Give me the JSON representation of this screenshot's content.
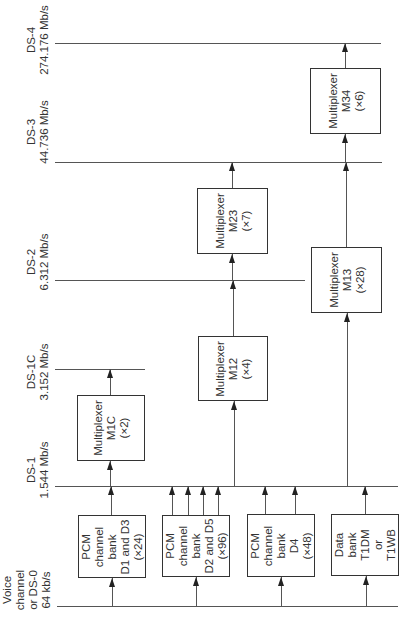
{
  "levels": [
    {
      "id": "ds4",
      "name": "DS-4",
      "rate": "274.176 Mb/s"
    },
    {
      "id": "ds3",
      "name": "DS-3",
      "rate": "44.736 Mb/s"
    },
    {
      "id": "ds2",
      "name": "DS-2",
      "rate": "6.312 Mb/s"
    },
    {
      "id": "ds1c",
      "name": "DS-1C",
      "rate": "3.152 Mb/s"
    },
    {
      "id": "ds1",
      "name": "DS-1",
      "rate": "1.544 Mb/s"
    },
    {
      "id": "ds0",
      "lines": [
        "Voice",
        "channel",
        "or DS-0",
        "64 kb/s"
      ]
    }
  ],
  "multiplexers": {
    "m34": {
      "lines": [
        "Multiplexer",
        "M34",
        "(×6)"
      ]
    },
    "m23": {
      "lines": [
        "Multiplexer",
        "M23",
        "(×7)"
      ]
    },
    "m13": {
      "lines": [
        "Multiplexer",
        "M13",
        "(×28)"
      ]
    },
    "m12": {
      "lines": [
        "Multiplexer",
        "M12",
        "(×4)"
      ]
    },
    "m1c": {
      "lines": [
        "Multiplexer",
        "M1C",
        "(×2)"
      ]
    }
  },
  "channel_banks": [
    {
      "lines": [
        "PCM",
        "channel",
        "bank",
        "D1 and D3",
        "(×24)"
      ]
    },
    {
      "lines": [
        "PCM",
        "channel",
        "bank",
        "D2 and D5",
        "(×96)"
      ]
    },
    {
      "lines": [
        "PCM",
        "channel",
        "bank",
        "D4",
        "(×48)"
      ]
    },
    {
      "lines": [
        "Data",
        "bank",
        "T1DM",
        "or",
        "T1WB"
      ]
    }
  ]
}
